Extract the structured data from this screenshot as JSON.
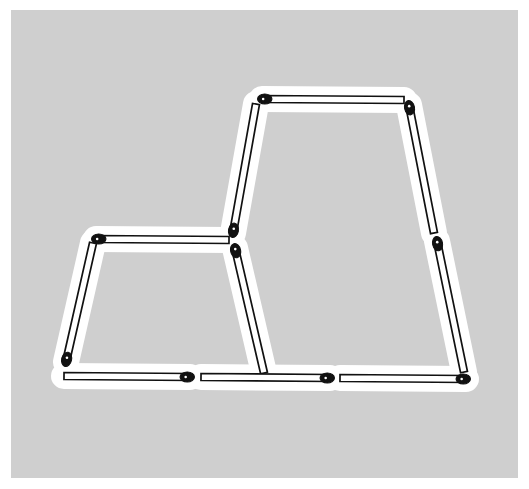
{
  "image": {
    "title": "Matchstick puzzle figure",
    "description": "Two adjoining trapezoid shapes formed from matchsticks",
    "width": 529,
    "height": 489,
    "background_color": "#ffffff",
    "canvas_color": "#cfcfcf",
    "halo_color": "#ffffff",
    "stick_body_color": "#ffffff",
    "stick_outline_color": "#111111",
    "stick_head_color": "#111111"
  },
  "figure": {
    "shapes": [
      {
        "name": "small-trapezoid",
        "position": "left",
        "label": "Left small trapezoid"
      },
      {
        "name": "large-trapezoid",
        "position": "right",
        "label": "Right large trapezoid"
      }
    ],
    "match_count": 11,
    "matches": [
      {
        "id": "m1",
        "name": "large-top",
        "x1": 262,
        "y1": 99,
        "x2": 404,
        "y2": 100,
        "head": "start"
      },
      {
        "id": "m2",
        "name": "large-left-upper",
        "x1": 256,
        "y1": 104,
        "x2": 233,
        "y2": 233,
        "head": "end"
      },
      {
        "id": "m3",
        "name": "large-right-upper",
        "x1": 409,
        "y1": 105,
        "x2": 434,
        "y2": 233,
        "head": "start"
      },
      {
        "id": "m4",
        "name": "large-right-lower",
        "x1": 437,
        "y1": 241,
        "x2": 464,
        "y2": 372,
        "head": "start"
      },
      {
        "id": "m5",
        "name": "small-top",
        "x1": 96,
        "y1": 239,
        "x2": 229,
        "y2": 240,
        "head": "start"
      },
      {
        "id": "m6",
        "name": "small-left",
        "x1": 93,
        "y1": 243,
        "x2": 66,
        "y2": 362,
        "head": "end"
      },
      {
        "id": "m7",
        "name": "shared-middle",
        "x1": 235,
        "y1": 248,
        "x2": 264,
        "y2": 373,
        "head": "start"
      },
      {
        "id": "m8",
        "name": "bottom-left",
        "x1": 64,
        "y1": 376,
        "x2": 190,
        "y2": 377,
        "head": "end"
      },
      {
        "id": "m9",
        "name": "bottom-middle",
        "x1": 201,
        "y1": 377,
        "x2": 330,
        "y2": 378,
        "head": "end"
      },
      {
        "id": "m10",
        "name": "bottom-right",
        "x1": 340,
        "y1": 378,
        "x2": 466,
        "y2": 379,
        "head": "end"
      }
    ]
  }
}
